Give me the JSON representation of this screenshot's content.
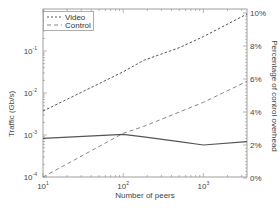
{
  "chart_data": {
    "type": "line",
    "title": "",
    "xlabel": "Number of peers",
    "ylabel": "Traffic (Gb/s)",
    "y2label": "Percentage of control overhead",
    "xscale": "log",
    "yscale": "log",
    "xlim": [
      10,
      3500
    ],
    "ylim": [
      0.0001,
      1
    ],
    "y2lim": [
      0,
      10
    ],
    "x_ticks": [
      {
        "value": 10,
        "base": "10",
        "exp": "1"
      },
      {
        "value": 100,
        "base": "10",
        "exp": "2"
      },
      {
        "value": 1000,
        "base": "10",
        "exp": "3"
      }
    ],
    "y_ticks": [
      {
        "value": 0.1,
        "base": "10",
        "exp": "-1"
      },
      {
        "value": 0.01,
        "base": "10",
        "exp": "-2"
      },
      {
        "value": 0.001,
        "base": "10",
        "exp": "-3"
      },
      {
        "value": 0.0001,
        "base": "10",
        "exp": "-4"
      }
    ],
    "y2_ticks": [
      "0%",
      "2%",
      "4%",
      "6%",
      "8%",
      "10%"
    ],
    "x": [
      10,
      100,
      180,
      500,
      1000,
      3500
    ],
    "series": [
      {
        "name": "Video",
        "axis": "left",
        "style": "dotted-dash",
        "values": [
          0.0037,
          0.032,
          0.06,
          0.12,
          0.22,
          0.76
        ]
      },
      {
        "name": "Control",
        "axis": "left",
        "style": "dashed",
        "values": [
          0.0001,
          0.0011,
          0.0016,
          0.0035,
          0.006,
          0.019
        ]
      },
      {
        "name": "Control overhead",
        "axis": "right",
        "style": "solid",
        "values": [
          2.4,
          2.65,
          2.5,
          2.2,
          2.0,
          2.2
        ]
      }
    ],
    "legend": {
      "position": "upper left",
      "entries": [
        "Video",
        "Control"
      ]
    },
    "grid": false
  },
  "labels": {
    "xlabel": "Number of peers",
    "ylabel": "Traffic (Gb/s)",
    "y2label": "Percentage of control overhead",
    "legend_video": "Video",
    "legend_control": "Control"
  },
  "colors": {
    "axis": "#888888",
    "video": "#555555",
    "control": "#888888",
    "overhead": "#555555"
  }
}
